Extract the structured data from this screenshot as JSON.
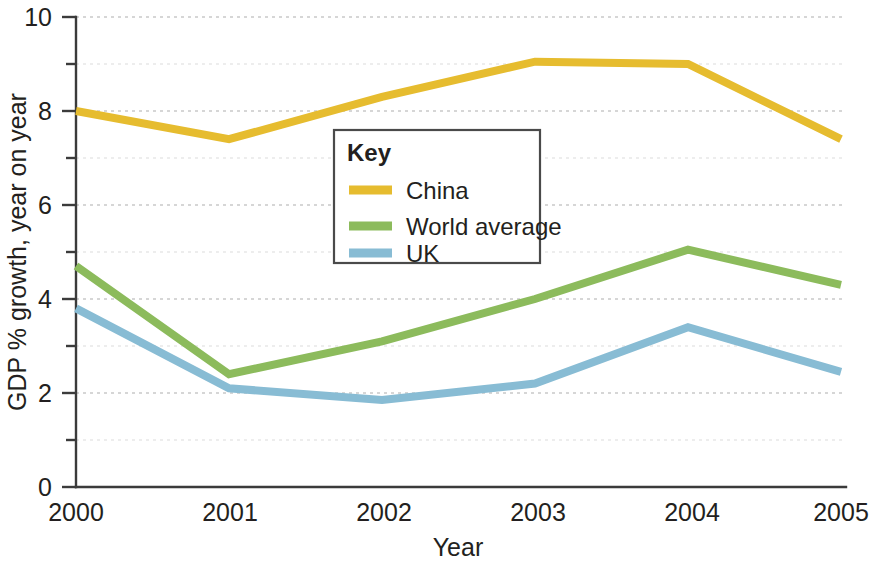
{
  "chart_data": {
    "type": "line",
    "title": "",
    "xlabel": "Year",
    "ylabel": "GDP % growth, year on year",
    "x": [
      2000,
      2001,
      2002,
      2003,
      2004,
      2005
    ],
    "categories": [
      "2000",
      "2001",
      "2002",
      "2003",
      "2004",
      "2005"
    ],
    "xlim": [
      2000,
      2005
    ],
    "ylim": [
      0,
      10
    ],
    "y_ticks": [
      0,
      2,
      4,
      6,
      8,
      10
    ],
    "y_tick_labels": [
      "0",
      "2",
      "4",
      "6",
      "8",
      "10"
    ],
    "y_minor_gridlines": [
      1,
      3,
      5,
      7,
      9
    ],
    "grid": true,
    "legend_position": "inside-upper-left",
    "series": [
      {
        "name": "China",
        "color": "#e6bc2f",
        "values": [
          8.0,
          7.4,
          8.3,
          9.05,
          9.0,
          7.4
        ]
      },
      {
        "name": "World average",
        "color": "#8cbb5c",
        "values": [
          4.7,
          2.4,
          3.1,
          4.0,
          5.05,
          4.3
        ]
      },
      {
        "name": "UK",
        "color": "#88bcd4",
        "values": [
          3.8,
          2.1,
          1.85,
          2.2,
          3.4,
          2.45
        ]
      }
    ]
  },
  "legend": {
    "title": "Key",
    "entries": [
      {
        "label": "China",
        "color": "#e6bc2f"
      },
      {
        "label": "World average",
        "color": "#8cbb5c"
      },
      {
        "label": "UK",
        "color": "#88bcd4"
      }
    ]
  },
  "axes": {
    "y_axis_title": "GDP % growth, year on year",
    "x_axis_title": "Year",
    "y_labels": [
      "10",
      "8",
      "6",
      "4",
      "2",
      "0"
    ],
    "x_labels": [
      "2000",
      "2001",
      "2002",
      "2003",
      "2004",
      "2005"
    ]
  },
  "colors": {
    "china": "#e6bc2f",
    "world_average": "#8cbb5c",
    "uk": "#88bcd4",
    "axis": "#3b3b3b",
    "gridline": "#c9c9c9",
    "text": "#231f20",
    "background": "#ffffff"
  }
}
